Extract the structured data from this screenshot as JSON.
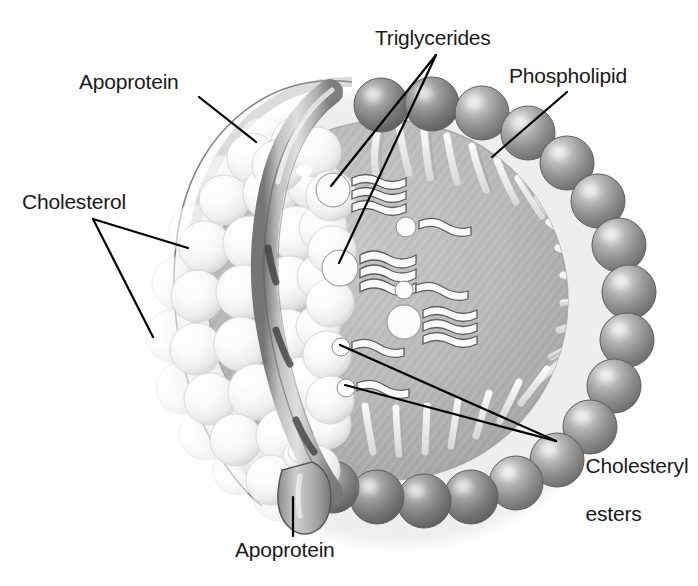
{
  "figure": {
    "kind": "lipoprotein-particle-cutaway-diagram",
    "style": "grayscale medical illustration",
    "background": "#ffffff"
  },
  "palette": {
    "background": "#ffffff",
    "label_text": "#1a1a1a",
    "leader_line": "#000000",
    "core_fill": "#b9b9b9",
    "core_fill_dark": "#a2a2a2",
    "phospholipid_head": "#8e8e8e",
    "phospholipid_head_dark": "#6d6d6d",
    "phospholipid_highlight": "#d8d8d8",
    "phospholipid_tail": "#eeeeee",
    "cholesterol_sphere": "#fbfbfb",
    "cholesterol_shade": "#d9d9d9",
    "apoprotein_ribbon": "#a8a8a8",
    "apoprotein_ribbon_dark": "#5a5a5a",
    "outline": "#4a4a4a",
    "molecule_fill": "#fafafa",
    "molecule_outline": "#5c5c5c"
  },
  "labels": [
    {
      "id": "apoprotein-top",
      "text": "Apoprotein",
      "x": 79,
      "y": 70,
      "leader": [
        [
          199,
          97
        ],
        [
          256,
          142
        ]
      ]
    },
    {
      "id": "cholesterol",
      "text": "Cholesterol",
      "x": 22,
      "y": 190,
      "leader_origin": [
        93,
        219
      ],
      "leaders": [
        [
          [
            93,
            219
          ],
          [
            188,
            248
          ]
        ],
        [
          [
            93,
            219
          ],
          [
            153,
            337
          ]
        ]
      ]
    },
    {
      "id": "triglycerides",
      "text": "Triglycerides",
      "x": 375,
      "y": 26,
      "leader_origin": [
        436,
        55
      ],
      "leaders": [
        [
          [
            436,
            55
          ],
          [
            331,
            186
          ]
        ],
        [
          [
            436,
            55
          ],
          [
            339,
            263
          ]
        ]
      ]
    },
    {
      "id": "phospholipid",
      "text": "Phospholipid",
      "x": 509,
      "y": 64,
      "leader": [
        [
          567,
          92
        ],
        [
          492,
          157
        ]
      ]
    },
    {
      "id": "cholesteryl-esters",
      "text": "Cholesteryl\nesters",
      "line1": "Cholesteryl",
      "line2": "esters",
      "x": 563,
      "y": 430,
      "leader_origin": [
        556,
        441
      ],
      "leaders": [
        [
          [
            556,
            441
          ],
          [
            340,
            345
          ]
        ],
        [
          [
            556,
            441
          ],
          [
            345,
            385
          ]
        ]
      ]
    },
    {
      "id": "apoprotein-bottom",
      "text": "Apoprotein",
      "x": 235,
      "y": 538,
      "leader": [
        [
          293,
          536
        ],
        [
          293,
          497
        ]
      ]
    }
  ],
  "particle": {
    "center": [
      390,
      300
    ],
    "radius": 225,
    "core": {
      "label": "lipid core",
      "center": [
        388,
        300
      ],
      "radius": 178
    },
    "phospholipid_heads": {
      "count": 22,
      "head_radius": 27,
      "arc_start_deg": -122,
      "arc_end_deg": 108,
      "description": "gray spheres forming the outer monolayer arc on the right side"
    },
    "phospholipid_tails": {
      "count": 22,
      "description": "pale curved tails pointing inward from each head"
    },
    "cholesterol_spheres": {
      "count": 46,
      "description": "white spheres clustered on the left exterior of the particle"
    },
    "apoprotein_ribbon": {
      "description": "gray band winding vertically through the left side, ending in a rounded bulb at the bottom"
    },
    "core_molecules": {
      "triglycerides": {
        "count": 3,
        "tails_per_molecule": 3,
        "positions": [
          [
            331,
            186
          ],
          [
            339,
            263
          ],
          [
            398,
            319
          ]
        ]
      },
      "cholesteryl_esters": {
        "count": 4,
        "tails_per_molecule": 1,
        "positions": [
          [
            401,
            224
          ],
          [
            399,
            287
          ],
          [
            340,
            345
          ],
          [
            345,
            385
          ]
        ]
      }
    }
  }
}
